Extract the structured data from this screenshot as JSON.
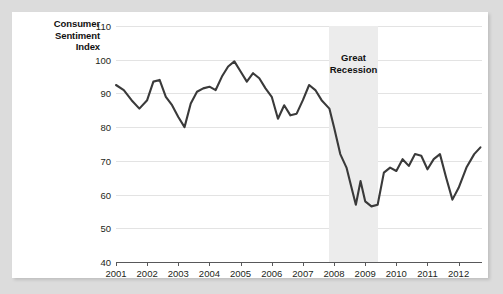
{
  "chart_data": {
    "type": "line",
    "title": "",
    "ylabel": "Consumer Sentiment Index",
    "xlabel": "",
    "ylim": [
      40,
      110
    ],
    "ytick_values": [
      40,
      50,
      60,
      70,
      80,
      90,
      100,
      110
    ],
    "xlim": [
      2001.0,
      2012.75
    ],
    "xtick_labels": [
      "2001",
      "2002",
      "2003",
      "2004",
      "2005",
      "2006",
      "2007",
      "2008",
      "2009",
      "2010",
      "2011",
      "2012"
    ],
    "xtick_values": [
      2001,
      2002,
      2003,
      2004,
      2005,
      2006,
      2007,
      2008,
      2009,
      2010,
      2011,
      2012
    ],
    "grid": "horizontal",
    "legend": "none",
    "line_color": "#3a3a3a",
    "grid_color": "#e3e3e3",
    "axis_color": "#58585a",
    "band_color": "#ececec",
    "annotations": [
      {
        "label": "Great Recession",
        "label_line1": "Great",
        "label_line2": "Recession",
        "type": "shaded-band",
        "x_start": 2007.83,
        "x_end": 2009.42
      }
    ],
    "series": [
      {
        "name": "Consumer Sentiment Index",
        "x": [
          2001.0,
          2001.25,
          2001.5,
          2001.75,
          2002.0,
          2002.2,
          2002.4,
          2002.6,
          2002.8,
          2003.0,
          2003.2,
          2003.4,
          2003.6,
          2003.8,
          2004.0,
          2004.2,
          2004.4,
          2004.6,
          2004.8,
          2005.0,
          2005.2,
          2005.4,
          2005.6,
          2005.8,
          2006.0,
          2006.2,
          2006.4,
          2006.6,
          2006.8,
          2007.0,
          2007.2,
          2007.4,
          2007.6,
          2007.85,
          2008.0,
          2008.2,
          2008.4,
          2008.55,
          2008.7,
          2008.85,
          2009.0,
          2009.2,
          2009.4,
          2009.6,
          2009.8,
          2010.0,
          2010.2,
          2010.4,
          2010.6,
          2010.8,
          2011.0,
          2011.2,
          2011.4,
          2011.6,
          2011.8,
          2012.0,
          2012.25,
          2012.5,
          2012.7
        ],
        "y": [
          92.5,
          91.0,
          88.0,
          85.5,
          88.0,
          93.5,
          94.0,
          89.0,
          86.5,
          83.0,
          80.0,
          87.0,
          90.5,
          91.5,
          92.0,
          91.0,
          95.0,
          98.0,
          99.5,
          96.5,
          93.5,
          96.0,
          94.5,
          91.5,
          89.0,
          82.5,
          86.5,
          83.5,
          84.0,
          88.0,
          92.5,
          91.0,
          88.0,
          85.5,
          80.0,
          72.0,
          68.0,
          62.5,
          57.0,
          64.0,
          58.0,
          56.5,
          57.0,
          66.5,
          68.0,
          67.0,
          70.5,
          68.5,
          72.0,
          71.5,
          67.5,
          70.5,
          72.0,
          65.0,
          58.5,
          62.0,
          68.0,
          72.0,
          74.0
        ]
      }
    ]
  }
}
